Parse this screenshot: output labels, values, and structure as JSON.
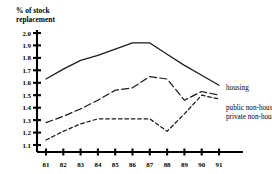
{
  "chart_data": {
    "type": "line",
    "title": "% of stock replacement",
    "title_line1": "% of stock",
    "title_line2": "replacement",
    "xlabel": "",
    "ylabel": "% of stock replacement",
    "x": [
      "81",
      "82",
      "83",
      "84",
      "85",
      "86",
      "87",
      "88",
      "89",
      "90",
      "91"
    ],
    "categories": [
      "81",
      "82",
      "83",
      "84",
      "85",
      "86",
      "87",
      "88",
      "89",
      "90",
      "91"
    ],
    "xlim": [
      "81",
      "91"
    ],
    "ylim": [
      1.1,
      2.0
    ],
    "ytick_labels": [
      "2.0",
      "1.9",
      "1.8",
      "1.7",
      "1.6",
      "1.5",
      "1.4",
      "1.3",
      "1.2",
      "1.1"
    ],
    "ytick_values": [
      2.0,
      1.9,
      1.8,
      1.7,
      1.6,
      1.5,
      1.4,
      1.3,
      1.2,
      1.1
    ],
    "xtick_labels": [
      "81",
      "82",
      "83",
      "84",
      "85",
      "86",
      "87",
      "88",
      "89",
      "90",
      "91"
    ],
    "grid": false,
    "legend_position": "right-inline-labels",
    "series": [
      {
        "name": "housing",
        "label": "housing",
        "style": "solid",
        "values": [
          1.63,
          1.71,
          1.78,
          1.82,
          1.87,
          1.92,
          1.92,
          1.83,
          1.74,
          1.66,
          1.58
        ]
      },
      {
        "name": "public non-housing",
        "label": "public non-housing",
        "style": "long-dashed",
        "values": [
          1.28,
          1.33,
          1.39,
          1.46,
          1.54,
          1.56,
          1.65,
          1.63,
          1.46,
          1.53,
          1.5
        ]
      },
      {
        "name": "private non-housing",
        "label": "private non-housing",
        "style": "short-dashed",
        "values": [
          1.14,
          1.21,
          1.27,
          1.31,
          1.31,
          1.31,
          1.31,
          1.21,
          1.35,
          1.5,
          1.47
        ]
      }
    ],
    "colors": {
      "line": "#1a1a1a",
      "axis": "#000000",
      "text": "#000000",
      "background": "#ffffff"
    }
  }
}
